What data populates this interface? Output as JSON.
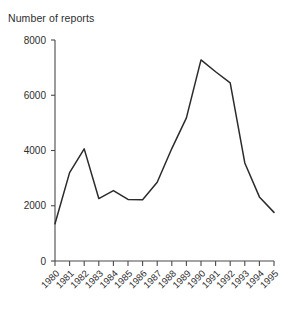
{
  "chart_data": {
    "type": "line",
    "title": "Number of reports",
    "xlabel": "",
    "ylabel": "Number of reports",
    "ylim": [
      0,
      8000
    ],
    "yticks": [
      0,
      2000,
      4000,
      6000,
      8000
    ],
    "ytick_labels": [
      "0",
      "2000",
      "4000",
      "6000",
      "8000"
    ],
    "grid": false,
    "legend": false,
    "legend_position": "none",
    "categories": [
      "1980",
      "1981",
      "1982",
      "1983",
      "1984",
      "1985",
      "1986",
      "1987",
      "1988",
      "1989",
      "1990",
      "1991",
      "1992",
      "1993",
      "1994",
      "1995"
    ],
    "values": [
      1350,
      3200,
      4060,
      2260,
      2550,
      2230,
      2220,
      2850,
      4070,
      5180,
      7280,
      6850,
      6450,
      3550,
      2320,
      1760
    ],
    "series": [
      {
        "name": "Number of reports",
        "values": [
          1350,
          3200,
          4060,
          2260,
          2550,
          2230,
          2220,
          2850,
          4070,
          5180,
          7280,
          6850,
          6450,
          3550,
          2320,
          1760
        ]
      }
    ],
    "line_color": "#2b2b2b",
    "xtick_label_rotation": -45
  }
}
